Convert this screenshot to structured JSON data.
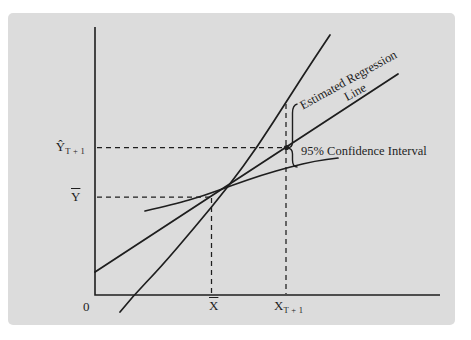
{
  "figure": {
    "background_color": "#dcdcdc",
    "ink_color": "#1e1e1e",
    "origin_label": "0",
    "x_axis": {
      "mean_label": {
        "base": "X",
        "overline": true
      },
      "forecast_label": {
        "base": "X",
        "subscript": "T + 1"
      }
    },
    "y_axis": {
      "forecast_label": {
        "base": "Ŷ",
        "subscript": "T + 1"
      },
      "mean_label": {
        "base": "Y",
        "overline": true
      }
    },
    "annotations": {
      "regression_label_line1": "Estimated Regression",
      "regression_label_line2": "Line",
      "confidence_label": "95% Confidence Interval"
    }
  },
  "chart_data": {
    "type": "line",
    "title": "",
    "xlabel": "",
    "ylabel": "",
    "grid": false,
    "axes_path": [
      [
        95,
        27
      ],
      [
        95,
        295
      ],
      [
        440,
        295
      ]
    ],
    "series": [
      {
        "name": "estimated-regression-line",
        "points": [
          [
            95,
            272
          ],
          [
            398,
            74
          ]
        ]
      },
      {
        "name": "upper-confidence-band",
        "points": [
          [
            120,
            312
          ],
          [
            133,
            296
          ],
          [
            160,
            268
          ],
          [
            195,
            227
          ],
          [
            228,
            187
          ],
          [
            258,
            146
          ],
          [
            288,
            99
          ],
          [
            312,
            62
          ],
          [
            330,
            35
          ]
        ]
      },
      {
        "name": "lower-confidence-band",
        "points": [
          [
            145,
            211
          ],
          [
            175,
            204
          ],
          [
            203,
            196
          ],
          [
            233,
            185
          ],
          [
            262,
            175
          ],
          [
            290,
            167
          ],
          [
            315,
            161
          ],
          [
            338,
            158
          ]
        ]
      }
    ],
    "dashed_guides": [
      {
        "name": "y-forecast-guide",
        "from": [
          97,
          147.5
        ],
        "to": [
          283,
          147.5
        ]
      },
      {
        "name": "y-mean-guide",
        "from": [
          97,
          197
        ],
        "to": [
          211,
          197
        ]
      },
      {
        "name": "x-mean-guide",
        "from": [
          211.5,
          198
        ],
        "to": [
          211.5,
          294
        ]
      },
      {
        "name": "x-forecast-guide",
        "from": [
          286,
          104
        ],
        "to": [
          286,
          294
        ]
      }
    ],
    "forecast_point": [
      286.5,
      147.5
    ],
    "brace": {
      "stem_x": 292.5,
      "top": 104,
      "bottom": 167,
      "tip_x": 286.8,
      "tip_y": 148
    }
  }
}
